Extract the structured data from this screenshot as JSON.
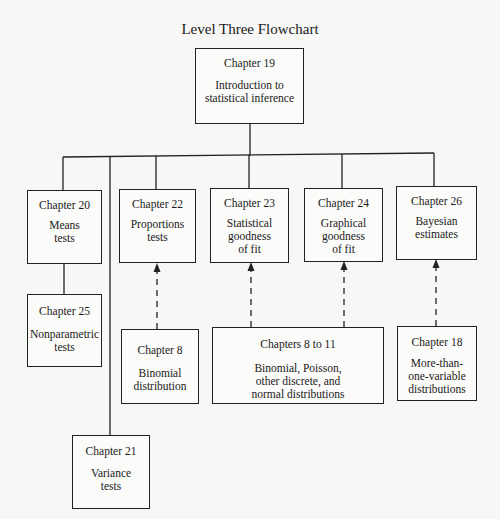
{
  "title": "Level Three Flowchart",
  "nodes": {
    "ch19": {
      "chapter": "Chapter 19",
      "description": "Introduction to\nstatistical inference"
    },
    "ch20": {
      "chapter": "Chapter 20",
      "description": "Means\ntests"
    },
    "ch22": {
      "chapter": "Chapter 22",
      "description": "Proportions\ntests"
    },
    "ch23": {
      "chapter": "Chapter 23",
      "description": "Statistical\ngoodness\nof fit"
    },
    "ch24": {
      "chapter": "Chapter 24",
      "description": "Graphical\ngoodness\nof fit"
    },
    "ch26": {
      "chapter": "Chapter 26",
      "description": "Bayesian\nestimates"
    },
    "ch25": {
      "chapter": "Chapter 25",
      "description": "Nonparametric\ntests"
    },
    "ch8": {
      "chapter": "Chapter 8",
      "description": "Binomial\ndistribution"
    },
    "ch8to11": {
      "chapter": "Chapters 8 to 11",
      "description": "Binomial, Poisson,\nother discrete, and\nnormal distributions"
    },
    "ch18": {
      "chapter": "Chapter 18",
      "description": "More-than-\none-variable\ndistributions"
    },
    "ch21": {
      "chapter": "Chapter 21",
      "description": "Variance\ntests"
    }
  },
  "edges": {
    "solid": [
      {
        "from": "ch19",
        "to": "ch20"
      },
      {
        "from": "ch19",
        "to": "ch21"
      },
      {
        "from": "ch19",
        "to": "ch22"
      },
      {
        "from": "ch19",
        "to": "ch23"
      },
      {
        "from": "ch19",
        "to": "ch24"
      },
      {
        "from": "ch19",
        "to": "ch26"
      },
      {
        "from": "ch20",
        "to": "ch25"
      }
    ],
    "dashed_prerequisite": [
      {
        "from": "ch8",
        "to": "ch22"
      },
      {
        "from": "ch8to11",
        "to": "ch23"
      },
      {
        "from": "ch8to11",
        "to": "ch24"
      },
      {
        "from": "ch18",
        "to": "ch26"
      }
    ]
  },
  "colors": {
    "line": "#222222",
    "background": "#f7f7f5"
  }
}
